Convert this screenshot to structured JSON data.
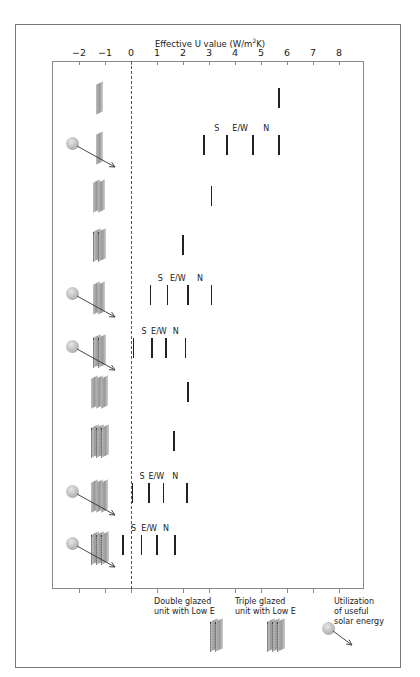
{
  "chart_data": {
    "type": "scatter",
    "title": "",
    "xlabel": "Effective U value (W/m²K)",
    "xlabel_parts": {
      "pre": "Effective U value (W/m",
      "sup": "2",
      "post": "K)"
    },
    "ylabel": "",
    "xlim": [
      -2,
      8
    ],
    "xticks": [
      -2,
      -1,
      0,
      1,
      2,
      3,
      4,
      5,
      6,
      7,
      8
    ],
    "reference_line": {
      "x": 0,
      "style": "dashed"
    },
    "grid": false,
    "rows": [
      {
        "id": "single",
        "glazing": "Single glazed",
        "solar": false,
        "values": [
          5.7
        ]
      },
      {
        "id": "single-solar",
        "glazing": "Single glazed",
        "solar": true,
        "labels": [
          "S",
          "E/W",
          "N"
        ],
        "values": [
          2.8,
          3.7,
          4.7,
          5.7
        ]
      },
      {
        "id": "double",
        "glazing": "Double glazed",
        "solar": false,
        "values": [
          3.1
        ]
      },
      {
        "id": "double-lowe",
        "glazing": "Double glazed unit with Low E",
        "solar": false,
        "values": [
          2.0
        ]
      },
      {
        "id": "double-solar",
        "glazing": "Double glazed",
        "solar": true,
        "labels": [
          "S",
          "E/W",
          "N"
        ],
        "values": [
          0.75,
          1.4,
          2.2,
          3.1
        ]
      },
      {
        "id": "double-lowe-solar",
        "glazing": "Double glazed unit with Low E",
        "solar": true,
        "labels": [
          "S",
          "E/W",
          "N"
        ],
        "values": [
          0.1,
          0.8,
          1.35,
          2.1
        ]
      },
      {
        "id": "triple",
        "glazing": "Triple glazed",
        "solar": false,
        "values": [
          2.2
        ]
      },
      {
        "id": "triple-lowe",
        "glazing": "Triple glazed unit with Low E",
        "solar": false,
        "values": [
          1.65
        ]
      },
      {
        "id": "triple-solar",
        "glazing": "Triple glazed",
        "solar": true,
        "labels": [
          "S",
          "E/W",
          "N"
        ],
        "values": [
          0.05,
          0.7,
          1.25,
          2.15
        ]
      },
      {
        "id": "triple-lowe-solar",
        "glazing": "Triple glazed unit with Low E",
        "solar": true,
        "labels": [
          "S",
          "E/W",
          "N"
        ],
        "values": [
          -0.3,
          0.4,
          1.0,
          1.7
        ]
      }
    ]
  },
  "legend": {
    "double_lowe": "Double glazed unit with Low E",
    "double_lowe_lines": [
      "Double glazed",
      "unit with Low E"
    ],
    "triple_lowe": "Triple glazed unit with Low E",
    "triple_lowe_lines": [
      "Triple glazed",
      "unit with Low E"
    ],
    "solar": "Utilization of useful solar energy",
    "solar_lines": [
      "Utilization",
      "of useful",
      "solar energy"
    ]
  },
  "colors": {
    "marker": "#222222",
    "frame": "#777777",
    "glass": "#9a9a9a",
    "sun": "#bdbdbd"
  }
}
